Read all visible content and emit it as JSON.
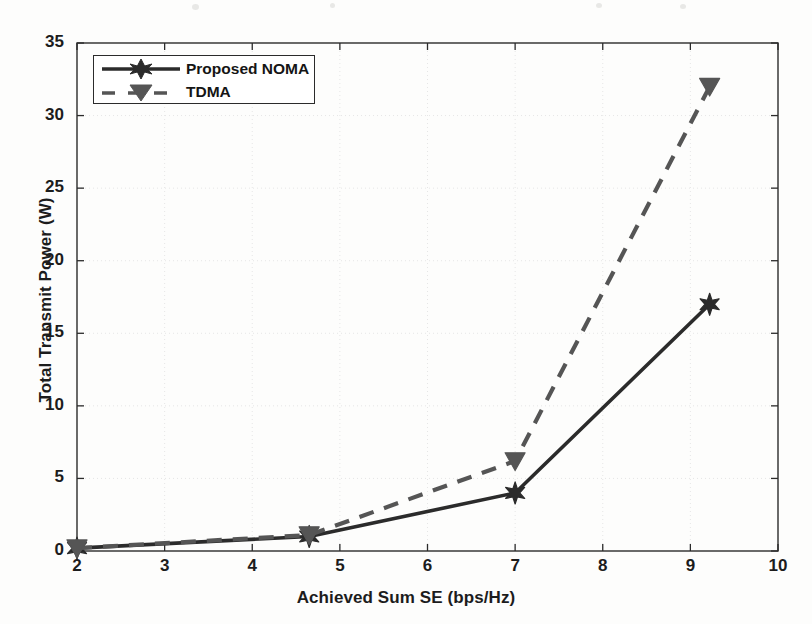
{
  "chart_data": {
    "type": "line",
    "title": "",
    "xlabel": "Achieved Sum SE (bps/Hz)",
    "ylabel": "Total Transmit Power (W)",
    "xlim": [
      2,
      10
    ],
    "ylim": [
      0,
      35
    ],
    "xticks": [
      2,
      3,
      4,
      5,
      6,
      7,
      8,
      9,
      10
    ],
    "xtick_labels": [
      "2",
      "3",
      "4",
      "5",
      "6",
      "7",
      "8",
      "9",
      "10"
    ],
    "yticks": [
      0,
      5,
      10,
      15,
      20,
      25,
      30,
      35
    ],
    "ytick_labels": [
      "0",
      "5",
      "10",
      "15",
      "20",
      "25",
      "30",
      "35"
    ],
    "grid": true,
    "legend_position": "upper left",
    "series": [
      {
        "name": "Proposed NOMA",
        "marker": "hexagram-star",
        "linestyle": "solid",
        "color": "#2b2b2b",
        "x": [
          2,
          4.65,
          7,
          9.22
        ],
        "values": [
          0.2,
          1.0,
          4.0,
          17.0
        ]
      },
      {
        "name": "TDMA",
        "marker": "triangle-down",
        "linestyle": "dashed",
        "color": "#555555",
        "x": [
          2,
          4.65,
          7,
          9.22
        ],
        "values": [
          0.2,
          1.1,
          6.2,
          32.0
        ]
      }
    ]
  },
  "legend": {
    "entries": [
      {
        "label": "Proposed NOMA"
      },
      {
        "label": "TDMA"
      }
    ]
  },
  "colors": {
    "axis": "#2b2b2b",
    "grid": "#e6e6e6",
    "noma": "#2b2b2b",
    "tdma": "#555555",
    "background": "#fdfdfc",
    "text": "#1c1c1c"
  }
}
